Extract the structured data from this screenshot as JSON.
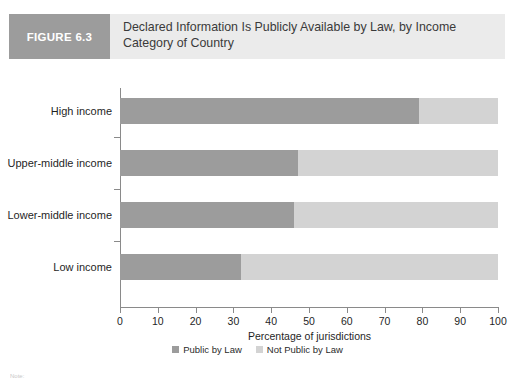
{
  "figure": {
    "tag": "FIGURE 6.3",
    "title": "Declared Information Is Publicly Available by Law, by Income Category of Country"
  },
  "note": {
    "text": "Note:"
  },
  "colors": {
    "public": "#9c9c9c",
    "not_public": "#d3d3d3",
    "tag_background": "#9c9c9c",
    "band_background": "#ebebeb",
    "axis": "#8a8a8a"
  },
  "legend": {
    "position": "bottom-center",
    "items": [
      {
        "label": "Public by Law",
        "color": "#9c9c9c"
      },
      {
        "label": "Not Public by Law",
        "color": "#d3d3d3"
      }
    ]
  },
  "chart_data": {
    "type": "bar",
    "orientation": "horizontal",
    "stacked": true,
    "stack_total": 100,
    "title": "Declared Information Is Publicly Available by Law, by Income Category of Country",
    "xlabel": "Percentage of jurisdictions",
    "ylabel": "",
    "xlim": [
      0,
      100
    ],
    "xticks": [
      0,
      10,
      20,
      30,
      40,
      50,
      60,
      70,
      80,
      90,
      100
    ],
    "xtick_labels": [
      "0",
      "10",
      "20",
      "30",
      "40",
      "50",
      "60",
      "70",
      "80",
      "90",
      "100"
    ],
    "grid": false,
    "categories": [
      "High income",
      "Upper-middle income",
      "Lower-middle income",
      "Low income"
    ],
    "series": [
      {
        "name": "Public by Law",
        "color": "#9c9c9c",
        "values": [
          79,
          47,
          46,
          32
        ]
      },
      {
        "name": "Not Public by Law",
        "color": "#d3d3d3",
        "values": [
          21,
          53,
          54,
          68
        ]
      }
    ]
  }
}
